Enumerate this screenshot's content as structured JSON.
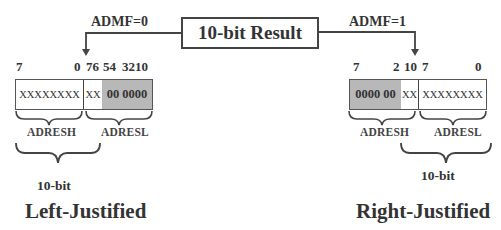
{
  "center": {
    "result_label": "10-bit Result"
  },
  "left": {
    "admf_label": "ADMF=0",
    "bit_labels": {
      "h7": "7",
      "h0": "0",
      "l76": "76",
      "l54": "54",
      "l3210": "3210"
    },
    "adresh_value": "XXXXXXXX",
    "adresl_xx": "XX",
    "adresl_zeros": "00 0000",
    "adresh_label": "ADRESH",
    "adresl_label": "ADRESL",
    "tenbit_label": "10-bit",
    "title": "Left-Justified"
  },
  "right": {
    "admf_label": "ADMF=1",
    "bit_labels": {
      "h7": "7",
      "h2": "2",
      "h10": "10",
      "l7": "7",
      "l0": "0"
    },
    "adresh_zeros": "0000 00",
    "adresh_xx": "XX",
    "adresl_value": "XXXXXXXX",
    "adresh_label": "ADRESH",
    "adresl_label": "ADRESL",
    "tenbit_label": "10-bit",
    "title": "Right-Justified"
  },
  "colors": {
    "shaded": "#b8b8b8",
    "line": "#444444",
    "text": "#333333"
  }
}
